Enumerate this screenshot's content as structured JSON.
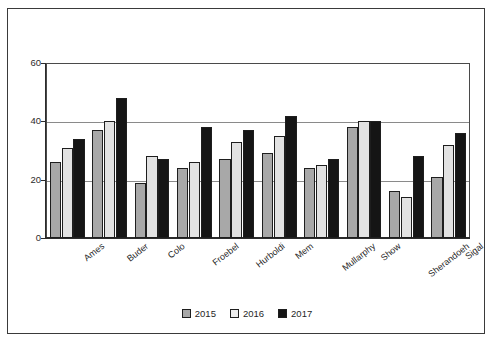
{
  "chart_data": {
    "type": "bar",
    "title": "",
    "xlabel": "",
    "ylabel": "",
    "ylim": [
      0,
      60
    ],
    "yticks": [
      0,
      20,
      40,
      60
    ],
    "grid": true,
    "legend_position": "bottom-center",
    "categories": [
      "Ames",
      "Buder",
      "Colo",
      "Froebel",
      "Hurboldi",
      "Mem",
      "Mullarphy",
      "Show",
      "Sherandoeh",
      "Sigal"
    ],
    "series": [
      {
        "name": "2015",
        "color": "#a8a8a8",
        "values": [
          26,
          37,
          19,
          24,
          27,
          29,
          24,
          38,
          16,
          21
        ]
      },
      {
        "name": "2016",
        "color": "#e2e2e2",
        "values": [
          31,
          40,
          28,
          26,
          33,
          35,
          25,
          40,
          14,
          32
        ]
      },
      {
        "name": "2017",
        "color": "#151515",
        "values": [
          34,
          48,
          27,
          38,
          37,
          42,
          27,
          40,
          28,
          36
        ]
      }
    ]
  },
  "legend": {
    "items": [
      {
        "label": "2015",
        "swatch": "series-2015-swatch"
      },
      {
        "label": "2016",
        "swatch": "series-2016-swatch"
      },
      {
        "label": "2017",
        "swatch": "series-2017-swatch"
      }
    ]
  }
}
